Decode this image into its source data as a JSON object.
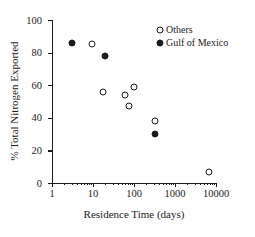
{
  "chart_data": {
    "type": "scatter",
    "title": "",
    "xlabel": "Residence Time (days)",
    "ylabel": "% Total Nitrogen Exported",
    "xscale": "log",
    "xlim": [
      1,
      10000
    ],
    "ylim": [
      0,
      100
    ],
    "grid": false,
    "legend_position": "top-right",
    "xticks": [
      {
        "value": 1,
        "label": "1"
      },
      {
        "value": 10,
        "label": "10"
      },
      {
        "value": 100,
        "label": "100"
      },
      {
        "value": 1000,
        "label": "1000"
      },
      {
        "value": 10000,
        "label": "10000"
      }
    ],
    "yticks": [
      {
        "value": 0,
        "label": "0"
      },
      {
        "value": 20,
        "label": "20"
      },
      {
        "value": 40,
        "label": "40"
      },
      {
        "value": 60,
        "label": "60"
      },
      {
        "value": 80,
        "label": "80"
      },
      {
        "value": 100,
        "label": "100"
      }
    ],
    "series": [
      {
        "name": "Others",
        "marker": "open-circle",
        "color": "#1a1a1a",
        "points": [
          {
            "x": 9.5,
            "y": 85
          },
          {
            "x": 18,
            "y": 56
          },
          {
            "x": 62,
            "y": 54
          },
          {
            "x": 75,
            "y": 47
          },
          {
            "x": 100,
            "y": 59
          },
          {
            "x": 330,
            "y": 38
          },
          {
            "x": 6800,
            "y": 7
          }
        ]
      },
      {
        "name": "Gulf of Mexico",
        "marker": "filled-circle",
        "color": "#1a1a1a",
        "points": [
          {
            "x": 3,
            "y": 86
          },
          {
            "x": 20,
            "y": 78
          },
          {
            "x": 330,
            "y": 30
          }
        ]
      }
    ]
  },
  "legend": {
    "entries": [
      {
        "label": "Others",
        "marker": "open-circle"
      },
      {
        "label": "Gulf of Mexico",
        "marker": "filled-circle"
      }
    ]
  }
}
